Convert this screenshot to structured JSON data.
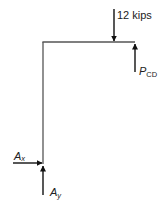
{
  "diagram": {
    "type": "free-body diagram",
    "members": [
      {
        "name": "vertical-member",
        "from": [
          43,
          42
        ],
        "to": [
          43,
          164
        ]
      },
      {
        "name": "horizontal-member",
        "from": [
          42,
          42
        ],
        "to": [
          135,
          42
        ]
      }
    ],
    "loads": {
      "applied_load": {
        "label": "12 kips",
        "direction": "down"
      },
      "p_cd": {
        "label_main": "P",
        "label_sub": "CD",
        "direction": "up"
      },
      "a_x": {
        "label_main": "A",
        "label_sub": "x",
        "direction": "right"
      },
      "a_y": {
        "label_main": "A",
        "label_sub": "y",
        "direction": "up"
      }
    },
    "colors": {
      "member": "#555555",
      "arrow": "#111111",
      "text": "#222222"
    }
  }
}
